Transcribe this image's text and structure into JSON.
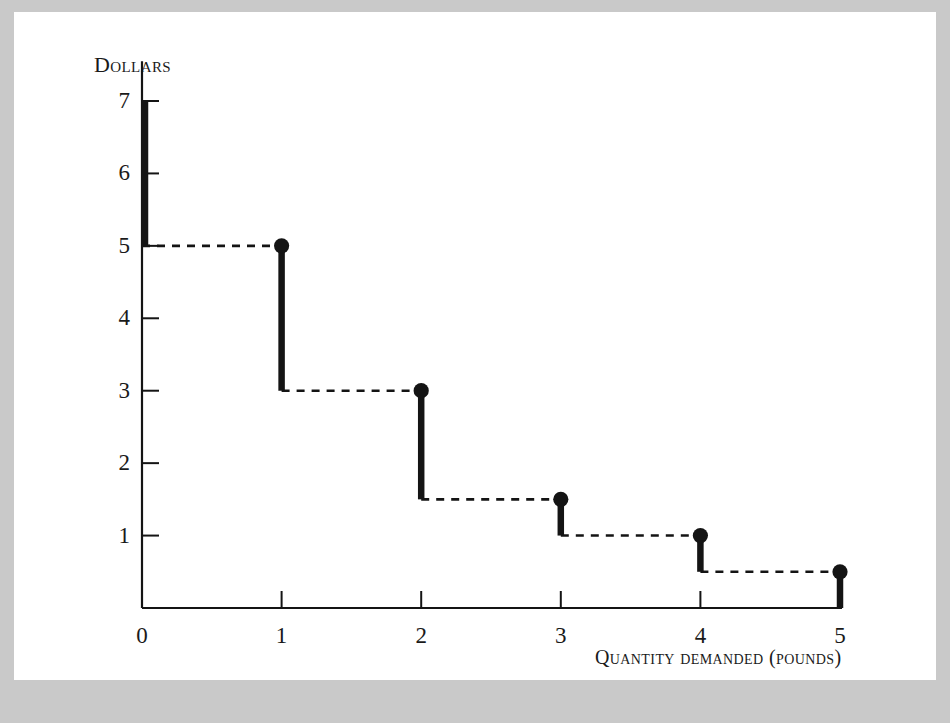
{
  "figure": {
    "panel_background": "#ffffff",
    "outer_background": "#c9c9c9",
    "ink_color": "#141414"
  },
  "chart_data": {
    "type": "line",
    "subtype": "step-function",
    "title": "",
    "xlabel": "Quantity demanded (pounds)",
    "ylabel": "Dollars",
    "xlim": [
      0,
      5
    ],
    "ylim": [
      0,
      7.4
    ],
    "grid": false,
    "legend": null,
    "x_ticks": [
      0,
      1,
      2,
      3,
      4,
      5
    ],
    "x_tick_labels": [
      "0",
      "1",
      "2",
      "3",
      "4",
      "5"
    ],
    "y_ticks": [
      1,
      2,
      3,
      4,
      5,
      6,
      7
    ],
    "y_tick_labels": [
      "1",
      "2",
      "3",
      "4",
      "5",
      "6",
      "7"
    ],
    "x": [
      0,
      1,
      2,
      3,
      4,
      5
    ],
    "values": [
      7,
      5,
      3,
      1.5,
      1,
      0.5
    ],
    "points": [
      {
        "x": 1,
        "y": 5,
        "marker": true,
        "drop_to": 3
      },
      {
        "x": 2,
        "y": 3,
        "marker": true,
        "drop_to": 1.5
      },
      {
        "x": 3,
        "y": 1.5,
        "marker": true,
        "drop_to": 1
      },
      {
        "x": 4,
        "y": 1,
        "marker": true,
        "drop_to": 0.5
      },
      {
        "x": 5,
        "y": 0.5,
        "marker": true,
        "drop_to": 0
      }
    ],
    "axis_bar": {
      "x": 0,
      "y_top": 7,
      "y_bottom": 5,
      "marker": false
    },
    "steps": [
      {
        "from_x": 0,
        "to_x": 1,
        "y": 5,
        "style": "dashed"
      },
      {
        "from_x": 1,
        "to_x": 2,
        "y": 3,
        "style": "dashed"
      },
      {
        "from_x": 2,
        "to_x": 3,
        "y": 1.5,
        "style": "dashed"
      },
      {
        "from_x": 3,
        "to_x": 4,
        "y": 1,
        "style": "dashed"
      },
      {
        "from_x": 4,
        "to_x": 5,
        "y": 0.5,
        "style": "dashed"
      }
    ]
  }
}
